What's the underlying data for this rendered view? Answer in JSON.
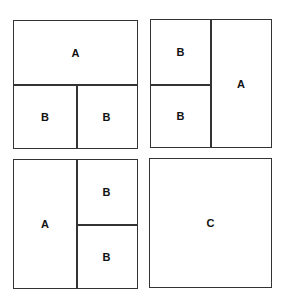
{
  "panels": [
    {
      "name": "layout-1",
      "cells": [
        {
          "label": "A",
          "region": "top"
        },
        {
          "label": "B",
          "region": "bottom-left"
        },
        {
          "label": "B",
          "region": "bottom-right"
        }
      ]
    },
    {
      "name": "layout-2",
      "cells": [
        {
          "label": "B",
          "region": "top-left"
        },
        {
          "label": "B",
          "region": "bottom-left"
        },
        {
          "label": "A",
          "region": "right"
        }
      ]
    },
    {
      "name": "layout-3",
      "cells": [
        {
          "label": "A",
          "region": "left"
        },
        {
          "label": "B",
          "region": "top-right"
        },
        {
          "label": "B",
          "region": "bottom-right"
        }
      ]
    },
    {
      "name": "layout-4",
      "cells": [
        {
          "label": "C",
          "region": "full"
        }
      ]
    }
  ],
  "colors": {
    "stroke": "#333333",
    "background": "#ffffff",
    "text": "#111111"
  }
}
